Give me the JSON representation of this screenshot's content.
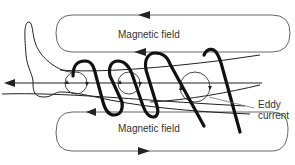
{
  "diagram": {
    "labels": {
      "magnetic_field_top": "Magnetic field",
      "magnetic_field_bottom": "Magnetic field",
      "eddy_current_line1": "Eddy",
      "eddy_current_line2": "current"
    },
    "colors": {
      "line": "#333333",
      "coil": "#111111",
      "field_loop": "#555555",
      "background": "#ffffff"
    },
    "elements": {
      "field_loops": 2,
      "eddy_circles": 3,
      "coil_turns": 3,
      "axis_arrow_direction": "left"
    }
  }
}
